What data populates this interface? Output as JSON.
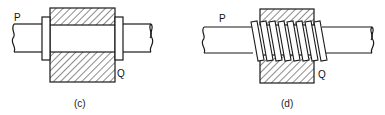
{
  "figures": [
    {
      "id": "c",
      "caption": "(c)",
      "labels": {
        "left": "P",
        "right": "Q"
      },
      "description": "Shaft passing through a hatched block with collars on both sides"
    },
    {
      "id": "d",
      "caption": "(d)",
      "labels": {
        "left": "P",
        "right": "Q"
      },
      "description": "Shaft with helical screw thread passing through a hatched block"
    }
  ],
  "colors": {
    "stroke": "#1a1a1a",
    "background": "#ffffff"
  }
}
